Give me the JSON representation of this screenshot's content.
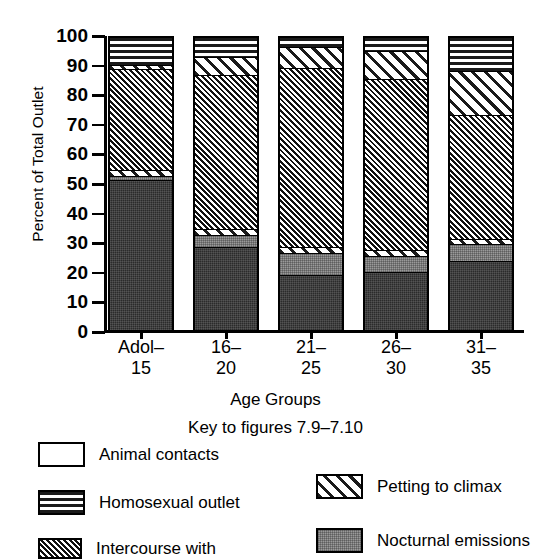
{
  "chart": {
    "ylabel": "Percent of Total Outlet",
    "xlabel": "Age Groups",
    "key_title": "Key to figures 7.9–7.10",
    "yticks": [
      "100",
      "90",
      "80",
      "70",
      "60",
      "50",
      "40",
      "30",
      "20",
      "10",
      "0"
    ],
    "categories_display": [
      "Adol–\n15",
      "16–\n20",
      "21–\n25",
      "26–\n30",
      "31–\n35"
    ]
  },
  "legend": {
    "left": [
      {
        "label": "Animal contacts",
        "pattern": "animal"
      },
      {
        "label": "Homosexual outlet",
        "pattern": "homosexual"
      },
      {
        "label": "Intercourse with",
        "pattern": "intercourse"
      }
    ],
    "right": [
      {
        "label": "Petting to climax",
        "pattern": "petting"
      },
      {
        "label": "Nocturnal emissions",
        "pattern": "nocturnal"
      }
    ]
  },
  "chart_data": {
    "type": "bar",
    "subtype": "stacked-vertical-100pct",
    "title": "",
    "xlabel": "Age Groups",
    "ylabel": "Percent of Total Outlet",
    "ylim": [
      0,
      100
    ],
    "ytick_step": 10,
    "grid": false,
    "legend_position": "below",
    "categories": [
      "Adol-15",
      "16-20",
      "21-25",
      "26-30",
      "31-35"
    ],
    "series": [
      {
        "name": "Masturbation",
        "pattern": "masturbation",
        "values": [
          52.0,
          29.5,
          20.0,
          21.0,
          24.5
        ]
      },
      {
        "name": "Nocturnal emissions",
        "pattern": "nocturnal",
        "values": [
          2.0,
          4.5,
          7.5,
          5.5,
          6.0
        ]
      },
      {
        "name": "Petting to climax",
        "pattern": "petting",
        "values": [
          1.5,
          1.5,
          1.5,
          1.5,
          1.5
        ]
      },
      {
        "name": "Intercourse with",
        "pattern": "intercourse",
        "values": [
          33.0,
          51.5,
          61.0,
          58.0,
          42.0
        ]
      },
      {
        "name": "Petting to climax (upper)",
        "pattern": "petting",
        "values": [
          1.5,
          6.0,
          7.0,
          9.5,
          15.0
        ]
      },
      {
        "name": "Homosexual outlet",
        "pattern": "homosexual",
        "values": [
          9.0,
          6.5,
          3.0,
          4.5,
          11.0
        ]
      },
      {
        "name": "Animal contacts",
        "pattern": "animal",
        "values": [
          1.0,
          0.5,
          0.0,
          0.0,
          0.0
        ]
      }
    ],
    "stack_order_bottom_to_top": [
      "Masturbation",
      "Nocturnal emissions",
      "Petting to climax",
      "Intercourse with",
      "Petting to climax (upper)",
      "Homosexual outlet",
      "Animal contacts"
    ],
    "bars": [
      {
        "category": "Adol-15",
        "segments": [
          {
            "name": "Masturbation",
            "pattern": "masturbation",
            "from": 0.0,
            "to": 52.0
          },
          {
            "name": "Nocturnal emissions",
            "pattern": "nocturnal",
            "from": 52.0,
            "to": 53.5
          },
          {
            "name": "Petting to climax",
            "pattern": "petting",
            "from": 53.5,
            "to": 55.5
          },
          {
            "name": "Intercourse with",
            "pattern": "intercourse",
            "from": 55.5,
            "to": 89.5
          },
          {
            "name": "Petting to climax",
            "pattern": "petting",
            "from": 89.5,
            "to": 91.0
          },
          {
            "name": "Homosexual outlet",
            "pattern": "homosexual",
            "from": 91.0,
            "to": 100.0
          }
        ]
      },
      {
        "category": "16-20",
        "segments": [
          {
            "name": "Masturbation",
            "pattern": "masturbation",
            "from": 0.0,
            "to": 29.5
          },
          {
            "name": "Nocturnal emissions",
            "pattern": "nocturnal",
            "from": 29.5,
            "to": 33.5
          },
          {
            "name": "Petting to climax",
            "pattern": "petting",
            "from": 33.5,
            "to": 35.5
          },
          {
            "name": "Intercourse with",
            "pattern": "intercourse",
            "from": 35.5,
            "to": 87.5
          },
          {
            "name": "Petting to climax",
            "pattern": "petting",
            "from": 87.5,
            "to": 93.5
          },
          {
            "name": "Homosexual outlet",
            "pattern": "homosexual",
            "from": 93.5,
            "to": 100.0
          }
        ]
      },
      {
        "category": "21-25",
        "segments": [
          {
            "name": "Masturbation",
            "pattern": "masturbation",
            "from": 0.0,
            "to": 20.0
          },
          {
            "name": "Nocturnal emissions",
            "pattern": "nocturnal",
            "from": 20.0,
            "to": 27.5
          },
          {
            "name": "Petting to climax",
            "pattern": "petting",
            "from": 27.5,
            "to": 29.5
          },
          {
            "name": "Intercourse with",
            "pattern": "intercourse",
            "from": 29.5,
            "to": 90.0
          },
          {
            "name": "Petting to climax",
            "pattern": "petting",
            "from": 90.0,
            "to": 97.0
          },
          {
            "name": "Homosexual outlet",
            "pattern": "homosexual",
            "from": 97.0,
            "to": 100.0
          }
        ]
      },
      {
        "category": "26-30",
        "segments": [
          {
            "name": "Masturbation",
            "pattern": "masturbation",
            "from": 0.0,
            "to": 21.0
          },
          {
            "name": "Nocturnal emissions",
            "pattern": "nocturnal",
            "from": 21.0,
            "to": 26.5
          },
          {
            "name": "Petting to climax",
            "pattern": "petting",
            "from": 26.5,
            "to": 28.5
          },
          {
            "name": "Intercourse with",
            "pattern": "intercourse",
            "from": 28.5,
            "to": 86.0
          },
          {
            "name": "Petting to climax",
            "pattern": "petting",
            "from": 86.0,
            "to": 95.5
          },
          {
            "name": "Homosexual outlet",
            "pattern": "homosexual",
            "from": 95.5,
            "to": 100.0
          }
        ]
      },
      {
        "category": "31-35",
        "segments": [
          {
            "name": "Masturbation",
            "pattern": "masturbation",
            "from": 0.0,
            "to": 24.5
          },
          {
            "name": "Nocturnal emissions",
            "pattern": "nocturnal",
            "from": 24.5,
            "to": 30.5
          },
          {
            "name": "Petting to climax",
            "pattern": "petting",
            "from": 30.5,
            "to": 32.0
          },
          {
            "name": "Intercourse with",
            "pattern": "intercourse",
            "from": 32.0,
            "to": 74.0
          },
          {
            "name": "Petting to climax",
            "pattern": "petting",
            "from": 74.0,
            "to": 89.0
          },
          {
            "name": "Homosexual outlet",
            "pattern": "homosexual",
            "from": 89.0,
            "to": 100.0
          }
        ]
      }
    ]
  }
}
